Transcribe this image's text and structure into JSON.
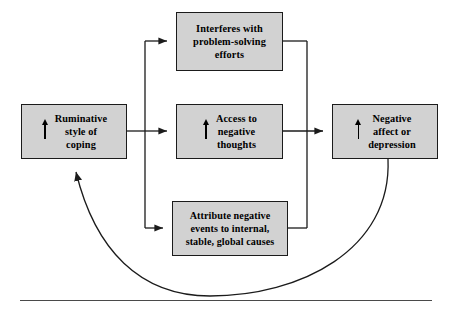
{
  "figure": {
    "background_color": "#ffffff",
    "box_fill_color": "#d2d2d2",
    "box_border_color": "#1b1b1b",
    "line_color": "#1b1b1b",
    "rule_color": "#4a4a4a"
  },
  "nodes": {
    "ruminative": {
      "label": "Ruminative\nstyle of\ncoping",
      "arrow_icon": "up-arrow-increase",
      "has_arrow": true
    },
    "interferes": {
      "label": "Interferes with\nproblem-solving\nefforts",
      "has_arrow": false
    },
    "access": {
      "label": "Access to\nnegative\nthoughts",
      "arrow_icon": "up-arrow-increase",
      "has_arrow": true
    },
    "attribute": {
      "label": "Attribute negative\nevents to internal,\nstable, global causes",
      "has_arrow": false
    },
    "negative_affect": {
      "label": "Negative\naffect or\ndepression",
      "arrow_icon": "up-arrow-increase",
      "has_arrow": true
    }
  },
  "edges": [
    {
      "name": "ruminative-to-interferes",
      "from": "ruminative",
      "to": "interferes",
      "style": "orthogonal-arrow"
    },
    {
      "name": "ruminative-to-access",
      "from": "ruminative",
      "to": "access",
      "style": "straight-arrow"
    },
    {
      "name": "ruminative-to-attribute",
      "from": "ruminative",
      "to": "attribute",
      "style": "orthogonal-arrow"
    },
    {
      "name": "interferes-to-negative-affect",
      "from": "interferes",
      "to": "negative_affect",
      "style": "orthogonal-merge"
    },
    {
      "name": "access-to-negative-affect",
      "from": "access",
      "to": "negative_affect",
      "style": "straight-arrow"
    },
    {
      "name": "attribute-to-negative-affect",
      "from": "attribute",
      "to": "negative_affect",
      "style": "orthogonal-merge"
    },
    {
      "name": "negative-affect-feedback-to-ruminative",
      "from": "negative_affect",
      "to": "ruminative",
      "style": "curved-feedback-arrow"
    }
  ]
}
